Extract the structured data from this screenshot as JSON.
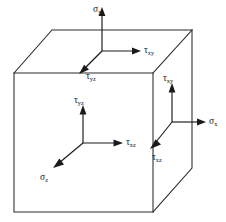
{
  "figure": {
    "background_color": "#ffffff",
    "line_color": "#2b2b2b",
    "arrow_color": "#1a1a1a",
    "width": 226,
    "height": 222
  },
  "cube": {
    "name": "stress-element-cube",
    "front_face": {
      "x1": 14,
      "y1": 73,
      "x2": 153,
      "y2": 212
    },
    "depth_offset": {
      "dx": 39,
      "dy": -43
    },
    "vertices": {
      "front_top_left": [
        14,
        73
      ],
      "front_top_right": [
        153,
        73
      ],
      "front_bottom_right": [
        153,
        212
      ],
      "front_bottom_left": [
        14,
        212
      ],
      "back_top_left": [
        52,
        30
      ],
      "back_top_right": [
        192,
        30
      ],
      "back_bottom_right": [
        192,
        168
      ]
    }
  },
  "triads": [
    {
      "id": "top-face-triad",
      "face": "top",
      "origin": [
        102,
        51
      ],
      "arrows": [
        {
          "id": "sigma-y-arrow",
          "symbol": "σ",
          "subscript": "y",
          "label": "σy",
          "direction": "up",
          "tip": [
            102,
            8
          ],
          "label_pos": [
            95,
            10
          ],
          "kind": "normal-stress"
        },
        {
          "id": "tau-xy-top-arrow",
          "symbol": "τ",
          "subscript": "xy",
          "label": "τxy",
          "direction": "right",
          "tip": [
            140,
            51
          ],
          "label_pos": [
            143,
            50
          ],
          "kind": "shear-stress"
        },
        {
          "id": "tau-yz-top-arrow",
          "symbol": "τ",
          "subscript": "yz",
          "label": "τyz",
          "direction": "down-left",
          "tip": [
            80,
            73
          ],
          "label_pos": [
            84,
            78
          ],
          "kind": "shear-stress"
        }
      ]
    },
    {
      "id": "front-face-triad",
      "face": "front",
      "origin": [
        83,
        143
      ],
      "arrows": [
        {
          "id": "tau-yz-front-arrow",
          "symbol": "τ",
          "subscript": "yz",
          "label": "τyz",
          "direction": "up",
          "tip": [
            83,
            106
          ],
          "label_pos": [
            76,
            103
          ],
          "kind": "shear-stress"
        },
        {
          "id": "tau-xz-front-arrow",
          "symbol": "τ",
          "subscript": "xz",
          "label": "τxz",
          "direction": "right",
          "tip": [
            122,
            143
          ],
          "label_pos": [
            125,
            142
          ],
          "kind": "shear-stress"
        },
        {
          "id": "sigma-z-arrow",
          "symbol": "σ",
          "subscript": "z",
          "label": "σz",
          "direction": "down-left",
          "tip": [
            54,
            168
          ],
          "label_pos": [
            44,
            177
          ],
          "kind": "normal-stress"
        }
      ]
    },
    {
      "id": "right-face-triad",
      "face": "right",
      "origin": [
        172,
        122
      ],
      "arrows": [
        {
          "id": "tau-xy-right-arrow",
          "symbol": "τ",
          "subscript": "xy",
          "label": "τxy",
          "direction": "up",
          "tip": [
            172,
            84
          ],
          "label_pos": [
            165,
            80
          ],
          "kind": "shear-stress"
        },
        {
          "id": "sigma-x-arrow",
          "symbol": "σ",
          "subscript": "x",
          "label": "σx",
          "direction": "right",
          "tip": [
            205,
            122
          ],
          "label_pos": [
            208,
            121
          ],
          "kind": "normal-stress"
        },
        {
          "id": "tau-xz-right-arrow",
          "symbol": "τ",
          "subscript": "xz",
          "label": "τxz",
          "direction": "down-left",
          "tip": [
            151,
            147
          ],
          "label_pos": [
            155,
            157
          ],
          "kind": "shear-stress"
        }
      ]
    }
  ],
  "labels": {
    "sigma_y": {
      "base": "σ",
      "sub": "y"
    },
    "tau_xy_top": {
      "base": "τ",
      "sub": "xy"
    },
    "tau_yz_top": {
      "base": "τ",
      "sub": "yz"
    },
    "tau_yz_front": {
      "base": "τ",
      "sub": "yz"
    },
    "tau_xz_front": {
      "base": "τ",
      "sub": "xz"
    },
    "sigma_z": {
      "base": "σ",
      "sub": "z"
    },
    "tau_xy_right": {
      "base": "τ",
      "sub": "xy"
    },
    "sigma_x": {
      "base": "σ",
      "sub": "x"
    },
    "tau_xz_right": {
      "base": "τ",
      "sub": "xz"
    }
  }
}
